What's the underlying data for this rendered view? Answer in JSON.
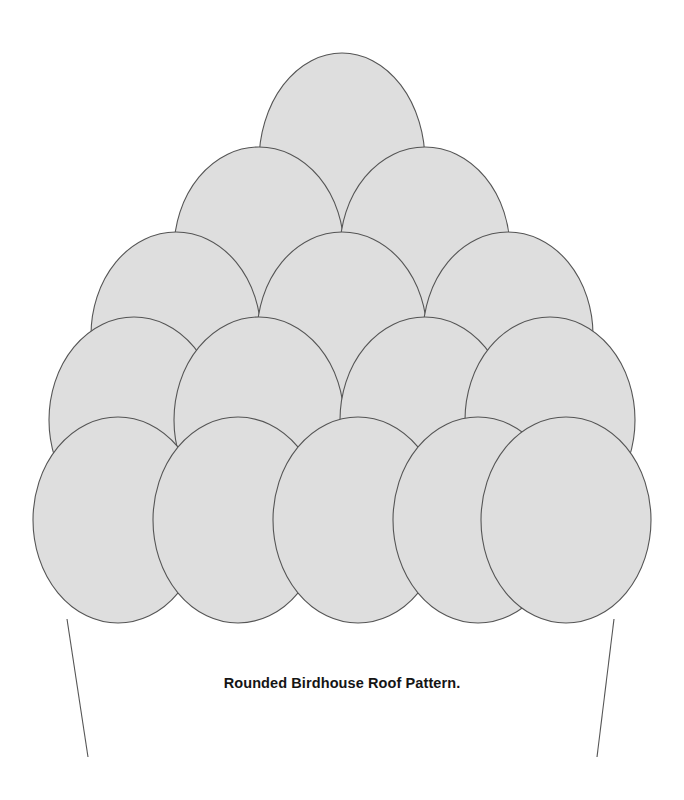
{
  "figure": {
    "caption": "Rounded Birdhouse Roof Pattern.",
    "title": "Rounded Birdhouse Roof Pattern",
    "background_color": "#ffffff",
    "shingle_fill": "#dedede",
    "shingle_stroke": "#555555",
    "shingle_stroke_width": 1.1,
    "wall_line_color": "#555555",
    "wall_line_width": 1.1,
    "canvas": {
      "width": 684,
      "height": 800
    }
  },
  "pattern": {
    "type": "overlapping-ellipse-shingles",
    "row_count": 5,
    "shingle_count": 15,
    "rows": [
      {
        "index": 1,
        "name": "row-1-apex",
        "count": 1,
        "rx": 83,
        "ry": 109,
        "cy": 162,
        "cx": [
          342
        ]
      },
      {
        "index": 2,
        "name": "row-2",
        "count": 2,
        "rx": 85,
        "ry": 103,
        "cy": 250,
        "cx": [
          259,
          425
        ]
      },
      {
        "index": 3,
        "name": "row-3",
        "count": 3,
        "rx": 85,
        "ry": 103,
        "cy": 335,
        "cx": [
          176,
          342,
          508
        ]
      },
      {
        "index": 4,
        "name": "row-4",
        "count": 4,
        "rx": 85,
        "ry": 103,
        "cy": 420,
        "cx": [
          134,
          259,
          425,
          550
        ]
      },
      {
        "index": 5,
        "name": "row-5-eave",
        "count": 5,
        "rx": 85,
        "ry": 103,
        "cy": 520,
        "cx": [
          118,
          238,
          358,
          478,
          566
        ]
      }
    ]
  },
  "wall_lines": [
    {
      "name": "left-wall-line",
      "x1": 67,
      "y1": 619,
      "x2": 88,
      "y2": 757
    },
    {
      "name": "right-wall-line",
      "x1": 614,
      "y1": 619,
      "x2": 597,
      "y2": 757
    }
  ]
}
